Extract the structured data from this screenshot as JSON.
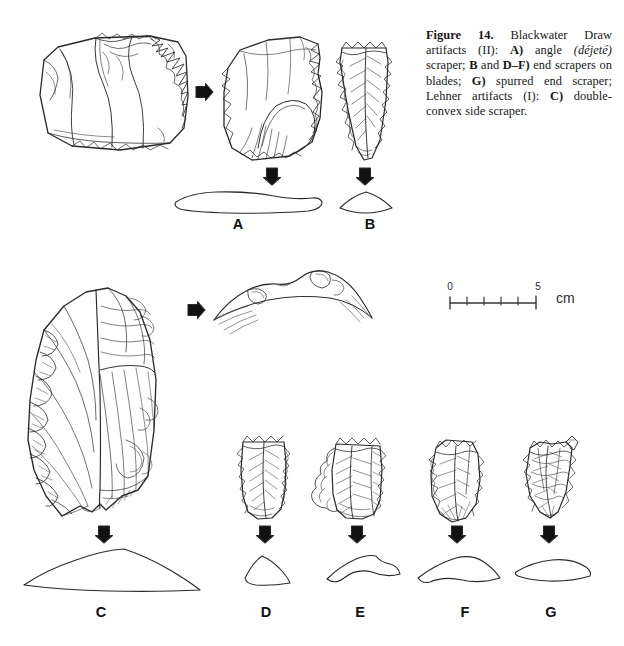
{
  "figure": {
    "number_label": "Figure 14.",
    "caption_parts": {
      "p1": " Blackwater Draw artifacts (II): ",
      "a_key": "A)",
      "p2": " angle ",
      "dejete": "(déjeté)",
      "p3": " scraper; ",
      "b_key": "B",
      "p4": " and ",
      "df_key": "D–F)",
      "p5": " end scrapers on blades; ",
      "g_key": "G)",
      "p6": " spurred end scraper; Lehner artifacts (I): ",
      "c_key": "C)",
      "p7": " double-convex side scraper."
    },
    "caption_plain": "Figure 14. Blackwater Draw artifacts (II): A) angle (déjeté) scraper; B and D–F) end scrapers on blades; G) spurred end scraper; Lehner artifacts (I): C) double-convex side scraper."
  },
  "scale": {
    "min_label": "0",
    "max_label": "5",
    "unit_label": "cm",
    "segments": 5,
    "tick_count": 6
  },
  "specimens": [
    {
      "id": "A",
      "label": "A",
      "name": "angle-dejete-scraper",
      "site": "Blackwater Draw",
      "views": [
        "dorsal",
        "ventral",
        "section"
      ]
    },
    {
      "id": "B",
      "label": "B",
      "name": "end-scraper-on-blade",
      "site": "Blackwater Draw",
      "views": [
        "dorsal",
        "section"
      ]
    },
    {
      "id": "C",
      "label": "C",
      "name": "double-convex-side-scraper",
      "site": "Lehner",
      "views": [
        "dorsal",
        "edge",
        "section"
      ]
    },
    {
      "id": "D",
      "label": "D",
      "name": "end-scraper-on-blade",
      "site": "Blackwater Draw",
      "views": [
        "dorsal",
        "section"
      ]
    },
    {
      "id": "E",
      "label": "E",
      "name": "end-scraper-on-blade",
      "site": "Blackwater Draw",
      "views": [
        "dorsal",
        "section"
      ]
    },
    {
      "id": "F",
      "label": "F",
      "name": "end-scraper-on-blade",
      "site": "Blackwater Draw",
      "views": [
        "dorsal",
        "section"
      ]
    },
    {
      "id": "G",
      "label": "G",
      "name": "spurred-end-scraper",
      "site": "Blackwater Draw",
      "views": [
        "dorsal",
        "section"
      ]
    }
  ],
  "colors": {
    "background": "#ffffff",
    "ink": "#1a1a1a",
    "outline": "#2a2a2a",
    "arrow": "#111111"
  }
}
